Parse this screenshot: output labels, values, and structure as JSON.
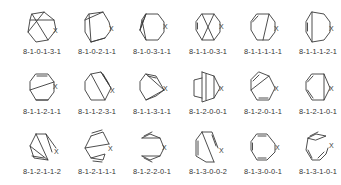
{
  "figure": {
    "rows": 3,
    "columns": 6,
    "heteroatom_label": "X",
    "line_color": "#3a3a3a",
    "text_color": "#333333",
    "structures": [
      {
        "label": "8-1-0-1-3-1",
        "paths": [
          "M10 6 L22 4 L32 12 L34 22 L26 32 L14 34 L6 24 L8 12 Z",
          "M10 6 L26 32",
          "M8 12 L32 12",
          "M6 24 L22 4"
        ],
        "x_pos": [
          31,
          25
        ]
      },
      {
        "label": "8-1-0-2-1-1",
        "paths": [
          "M12 6 L26 4 L32 14 L34 22 L28 30 L14 34 L8 24 L8 12 Z",
          "M12 6 L14 34",
          "M8 12 L26 4",
          "M14 34 L28 30"
        ],
        "x_pos": [
          32,
          23
        ]
      },
      {
        "label": "8-1-0-3-1-1",
        "paths": [
          "M14 6 L26 6 L32 14 L32 24 L26 32 L14 32 L8 22 L10 12 Z",
          "M10 12 L14 32",
          "M8 22 L14 6",
          "M14 6 L8 22"
        ],
        "x_pos": [
          31,
          21
        ]
      },
      {
        "label": "8-1-1-0-3-1",
        "paths": [
          "M14 6 L26 6 L32 14 L32 24 L26 32 L14 32 L8 22 L8 14 Z",
          "M14 6 L26 32",
          "M26 6 L14 32",
          "M9.5 15 L9.5 21"
        ],
        "x_pos": [
          31,
          21
        ]
      },
      {
        "label": "8-1-1-1-1-1",
        "paths": [
          "M14 6 L26 6 L32 14 L32 24 L26 32 L14 32 L8 22 L8 14 Z",
          "M26 6 L20 32",
          "M9.5 14 L15 8"
        ],
        "x_pos": [
          31,
          23
        ]
      },
      {
        "label": "8-1-1-1-2-1",
        "paths": [
          "M14 4 L26 6 L32 14 L32 24 L26 32 L14 34 L8 24 L8 14 Z",
          "M14 4 L14 34",
          "M9.5 15 L9.5 23"
        ],
        "x_pos": [
          31,
          23
        ]
      },
      {
        "label": "8-1-1-2-1-1",
        "paths": [
          "M14 6 L26 6 L32 14 L32 24 L26 32 L14 32 L8 22 L8 14 Z",
          "M8 22 L32 14",
          "M14 32 L26 32",
          "M15 8 L25 8"
        ],
        "x_pos": [
          31,
          21
        ]
      },
      {
        "label": "8-1-1-2-3-1",
        "paths": [
          "M14 6 L24 4 L34 20 L28 32 L14 32 L8 22 L8 14 Z",
          "M14 6 L28 32",
          "M24 4 L34 20",
          "M26 6 L32 16"
        ],
        "x_pos": [
          33,
          25
        ]
      },
      {
        "label": "8-1-1-3-1-1",
        "paths": [
          "M14 6 L24 8 L32 22 L24 28 L14 32 L8 22 L8 14 Z",
          "M14 6 L32 22",
          "M14 32 L32 22",
          "M16 8 L24 10"
        ],
        "x_pos": [
          31,
          23
        ]
      },
      {
        "label": "8-1-2-0-0-1",
        "paths": [
          "M14 4 L26 8 L32 20 L26 30 L14 34 L14 4",
          "M18 6 L18 32",
          "M14 10 L6 12 L6 28 L14 30",
          "M26 8 L26 30"
        ],
        "x_pos": [
          31,
          23
        ]
      },
      {
        "label": "8-1-2-0-1-1",
        "paths": [
          "M16 4 L26 8 L32 20 L26 32 L14 32 L8 22 L8 12 Z",
          "M8 22 L26 8",
          "M10 13 L16 7",
          "M16 30 L25 30"
        ],
        "x_pos": [
          31,
          23
        ]
      },
      {
        "label": "8-1-2-1-0-1",
        "paths": [
          "M14 6 L26 6 L32 20 L26 32 L14 32 L8 22 L8 14 Z",
          "M26 6 L26 32",
          "M9.5 14 L15 8",
          "M9.5 22 L15 30"
        ],
        "x_pos": [
          31,
          23
        ]
      },
      {
        "label": "8-1-2-1-1-2",
        "paths": [
          "M14 6 L24 6 L34 20 M14 6 L8 18 L12 30 L26 32 L14 6",
          "M24 6 L30 24",
          "M26 32 L8 18",
          "M10 28 L22 30"
        ],
        "x_pos": [
          32,
          26
        ]
      },
      {
        "label": "8-1-2-1-1-1",
        "paths": [
          "M14 8 L26 4 L32 16 M14 8 L8 20 L14 30 L26 32 L28 26 L14 30",
          "M8 20 L32 16",
          "M15 5 L25 2",
          "M16 33 L25 34"
        ],
        "x_pos": [
          31,
          23
        ]
      },
      {
        "label": "8-1-2-2-0-1",
        "paths": [
          "M10 10 L18 6 L28 10 L32 20 L28 28 L18 32 L10 28",
          "M10 10 L28 10",
          "M10 28 L28 28",
          "M12 8 L20 4",
          "M12 30 L20 34"
        ],
        "x_pos": [
          30,
          22
        ]
      },
      {
        "label": "8-1-3-0-0-2",
        "paths": [
          "M14 4 L24 4 L30 20 M14 4 L8 12 L8 28 L18 34 L26 34",
          "M14 4 L26 34",
          "M10 13 L10 27",
          "M24 7 L28 18"
        ],
        "x_pos": [
          31,
          25
        ]
      },
      {
        "label": "8-1-3-0-0-1",
        "paths": [
          "M14 6 L24 6 L32 16 L32 24 L24 32 L14 32 L8 22 L8 14 Z",
          "M9.5 15 L9.5 22",
          "M15 8 L23 8",
          "M15 30 L23 30"
        ],
        "x_pos": [
          32,
          22
        ]
      },
      {
        "label": "8-1-3-1-0-1",
        "paths": [
          "M10 10 L18 6 L28 8 L18 12 Z",
          "M12 8 L20 4",
          "M10 10 L8 22 L14 32 L22 32 L28 26 L30 20",
          "M10 22 L14 30",
          "M20 30 L26 24"
        ],
        "x_pos": [
          31,
          20
        ]
      }
    ]
  }
}
